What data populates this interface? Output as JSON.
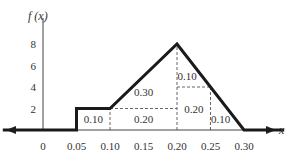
{
  "chart_data": {
    "type": "line",
    "title": "",
    "xlabel": "x",
    "ylabel": "f(x)",
    "x_ticks": [
      "0",
      "0.05",
      "0.10",
      "0.15",
      "0.20",
      "0.25",
      "0.30"
    ],
    "y_ticks": [
      "2",
      "4",
      "6",
      "8"
    ],
    "xlim": [
      0,
      0.3
    ],
    "ylim": [
      0,
      8
    ],
    "grid": false,
    "series": [
      {
        "name": "f(x)",
        "x": [
          -0.06,
          0.05,
          0.05,
          0.1,
          0.2,
          0.3,
          0.36
        ],
        "y": [
          0,
          0,
          2,
          2,
          8,
          0,
          0
        ]
      }
    ],
    "area_labels": [
      {
        "text": "0.10",
        "x": 0.075,
        "y": 1
      },
      {
        "text": "0.20",
        "x": 0.15,
        "y": 1
      },
      {
        "text": "0.30",
        "x": 0.15,
        "y": 3.5
      },
      {
        "text": "0.10",
        "x": 0.215,
        "y": 5
      },
      {
        "text": "0.20",
        "x": 0.225,
        "y": 2
      },
      {
        "text": "0.10",
        "x": 0.265,
        "y": 1
      }
    ],
    "annotations": [
      "Areas of sub-regions under the density curve sum to 1"
    ]
  },
  "labels": {
    "ylabel": "f (x)",
    "xlabel": "x"
  }
}
